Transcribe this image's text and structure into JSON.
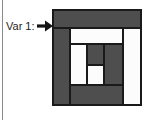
{
  "panel": {
    "border_line_color": "#8a8a8a"
  },
  "label": {
    "text": "Var 1:"
  },
  "arrow": {
    "meaning": "points-to-block-variation",
    "color": "#141414"
  },
  "block": {
    "kind": "log-cabin-quilt-block",
    "x": 53,
    "y": 10,
    "width": 88,
    "height": 95,
    "border_color": "#1a1a1a",
    "colors": {
      "dark": "#4e4e4e",
      "light": "#fcfcfc"
    },
    "pieces": [
      {
        "name": "outer-top-strip",
        "x": 0,
        "y": 0,
        "w": 88,
        "h": 18,
        "fill": "dark"
      },
      {
        "name": "outer-left-strip",
        "x": 0,
        "y": 18,
        "w": 17,
        "h": 77,
        "fill": "dark"
      },
      {
        "name": "inner-top-strip",
        "x": 17,
        "y": 18,
        "w": 53,
        "h": 16,
        "fill": "light"
      },
      {
        "name": "outer-right-strip",
        "x": 70,
        "y": 18,
        "w": 18,
        "h": 77,
        "fill": "light"
      },
      {
        "name": "inner-left-strip",
        "x": 17,
        "y": 34,
        "w": 17,
        "h": 41,
        "fill": "light"
      },
      {
        "name": "center-top-square",
        "x": 34,
        "y": 34,
        "w": 17,
        "h": 21,
        "fill": "dark"
      },
      {
        "name": "inner-right-strip",
        "x": 51,
        "y": 34,
        "w": 19,
        "h": 41,
        "fill": "dark"
      },
      {
        "name": "center-bottom-square",
        "x": 34,
        "y": 55,
        "w": 17,
        "h": 20,
        "fill": "light"
      },
      {
        "name": "bottom-strip",
        "x": 17,
        "y": 75,
        "w": 53,
        "h": 20,
        "fill": "dark"
      }
    ]
  }
}
